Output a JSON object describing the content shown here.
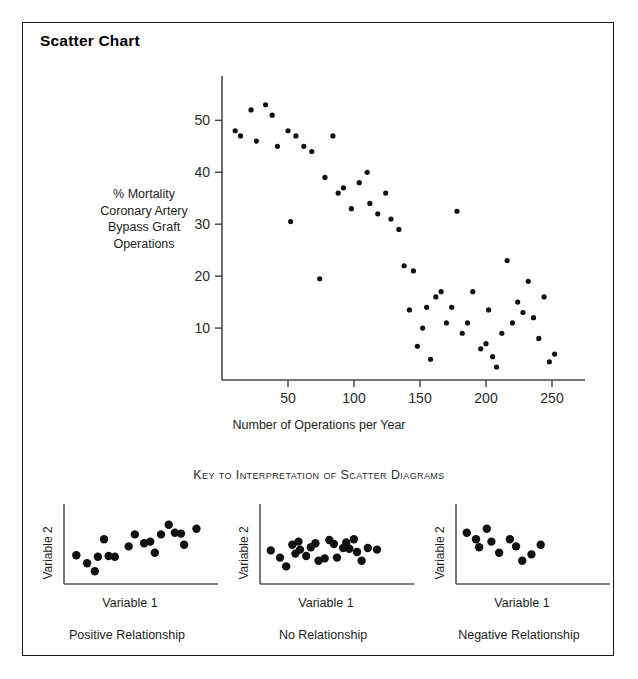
{
  "title": "Scatter Chart",
  "key_title": "Key to Interpretation of Scatter Diagrams",
  "colors": {
    "ink": "#1a1a1a",
    "axis": "#4a4a4a",
    "point": "#111111",
    "background": "#ffffff",
    "border": "#1a1a1a"
  },
  "chart_data": [
    {
      "type": "scatter",
      "name": "main-scatter",
      "title": "Scatter Chart",
      "xlabel": "Number of Operations per Year",
      "ylabel": "% Mortality Coronary Artery Bypass Graft Operations",
      "ylabel_lines": [
        "% Mortality",
        "Coronary Artery",
        "Bypass Graft",
        "Operations"
      ],
      "xlim": [
        0,
        275
      ],
      "ylim": [
        0,
        57
      ],
      "xticks": [
        50,
        100,
        150,
        200,
        250
      ],
      "yticks": [
        10,
        20,
        30,
        40,
        50
      ],
      "grid": false,
      "legend": "none",
      "points": [
        [
          10,
          48
        ],
        [
          14,
          47
        ],
        [
          22,
          52
        ],
        [
          26,
          46
        ],
        [
          33,
          53
        ],
        [
          38,
          51
        ],
        [
          42,
          45
        ],
        [
          50,
          48
        ],
        [
          52,
          30.5
        ],
        [
          56,
          47
        ],
        [
          62,
          45
        ],
        [
          68,
          44
        ],
        [
          74,
          19.5
        ],
        [
          78,
          39
        ],
        [
          84,
          47
        ],
        [
          88,
          36
        ],
        [
          92,
          37
        ],
        [
          98,
          33
        ],
        [
          104,
          38
        ],
        [
          110,
          40
        ],
        [
          112,
          34
        ],
        [
          118,
          32
        ],
        [
          124,
          36
        ],
        [
          128,
          31
        ],
        [
          134,
          29
        ],
        [
          138,
          22
        ],
        [
          142,
          13.5
        ],
        [
          145,
          21
        ],
        [
          148,
          6.5
        ],
        [
          152,
          10
        ],
        [
          155,
          14
        ],
        [
          158,
          4
        ],
        [
          162,
          16
        ],
        [
          166,
          17
        ],
        [
          170,
          11
        ],
        [
          174,
          14
        ],
        [
          178,
          32.5
        ],
        [
          182,
          9
        ],
        [
          186,
          11
        ],
        [
          190,
          17
        ],
        [
          196,
          6
        ],
        [
          200,
          7
        ],
        [
          202,
          13.5
        ],
        [
          205,
          4.5
        ],
        [
          208,
          2.5
        ],
        [
          212,
          9
        ],
        [
          216,
          23
        ],
        [
          220,
          11
        ],
        [
          224,
          15
        ],
        [
          228,
          13
        ],
        [
          232,
          19
        ],
        [
          236,
          12
        ],
        [
          240,
          8
        ],
        [
          244,
          16
        ],
        [
          248,
          3.5
        ],
        [
          252,
          5
        ]
      ]
    },
    {
      "type": "scatter",
      "name": "positive-relationship",
      "caption": "Positive Relationship",
      "xlabel": "Variable 1",
      "ylabel": "Variable 2",
      "xlim": [
        0,
        10
      ],
      "ylim": [
        0,
        10
      ],
      "grid": false,
      "points": [
        [
          0.8,
          3.6
        ],
        [
          1.5,
          2.6
        ],
        [
          2.0,
          1.6
        ],
        [
          2.2,
          3.4
        ],
        [
          2.6,
          5.6
        ],
        [
          2.9,
          3.5
        ],
        [
          3.3,
          3.4
        ],
        [
          4.2,
          4.7
        ],
        [
          4.6,
          6.2
        ],
        [
          5.2,
          5.1
        ],
        [
          5.6,
          5.3
        ],
        [
          5.9,
          3.9
        ],
        [
          6.3,
          6.2
        ],
        [
          6.8,
          7.4
        ],
        [
          7.2,
          6.4
        ],
        [
          7.6,
          6.3
        ],
        [
          7.8,
          4.9
        ],
        [
          8.6,
          6.9
        ]
      ]
    },
    {
      "type": "scatter",
      "name": "no-relationship",
      "caption": "No Relationship",
      "xlabel": "Variable 1",
      "ylabel": "Variable 2",
      "xlim": [
        0,
        10
      ],
      "ylim": [
        0,
        10
      ],
      "grid": false,
      "points": [
        [
          0.7,
          4.2
        ],
        [
          1.3,
          3.3
        ],
        [
          1.7,
          2.2
        ],
        [
          2.1,
          4.9
        ],
        [
          2.3,
          3.8
        ],
        [
          2.5,
          5.3
        ],
        [
          2.6,
          4.3
        ],
        [
          3.0,
          3.5
        ],
        [
          3.3,
          4.6
        ],
        [
          3.6,
          5.1
        ],
        [
          3.8,
          2.9
        ],
        [
          4.2,
          3.2
        ],
        [
          4.5,
          5.5
        ],
        [
          4.8,
          5.0
        ],
        [
          5.0,
          3.3
        ],
        [
          5.4,
          4.5
        ],
        [
          5.6,
          5.2
        ],
        [
          5.8,
          4.4
        ],
        [
          6.1,
          5.6
        ],
        [
          6.3,
          4.0
        ],
        [
          6.6,
          2.9
        ],
        [
          7.0,
          4.5
        ],
        [
          7.6,
          4.3
        ]
      ]
    },
    {
      "type": "scatter",
      "name": "negative-relationship",
      "caption": "Negative Relationship",
      "xlabel": "Variable 1",
      "ylabel": "Variable 2",
      "xlim": [
        0,
        10
      ],
      "ylim": [
        0,
        10
      ],
      "grid": false,
      "points": [
        [
          0.7,
          6.4
        ],
        [
          1.3,
          5.6
        ],
        [
          1.5,
          4.6
        ],
        [
          2.0,
          6.9
        ],
        [
          2.3,
          5.3
        ],
        [
          2.8,
          3.9
        ],
        [
          3.5,
          5.6
        ],
        [
          3.9,
          4.7
        ],
        [
          4.3,
          2.9
        ],
        [
          4.9,
          3.7
        ],
        [
          5.5,
          4.9
        ]
      ]
    }
  ]
}
